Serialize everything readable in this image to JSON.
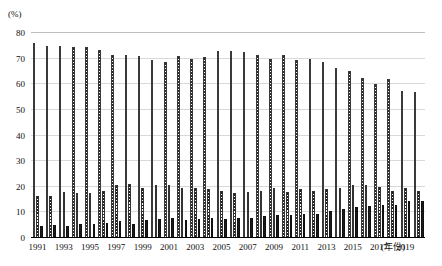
{
  "chart_data": {
    "type": "bar",
    "title": "",
    "subtitle": "",
    "xlabel": "(年份)",
    "ylabel": "(%)",
    "ylim": [
      0,
      80
    ],
    "ytick_values": [
      0,
      10,
      20,
      30,
      40,
      50,
      60,
      70,
      80
    ],
    "ytick_labels": [
      "0",
      "10",
      "20",
      "30",
      "40",
      "50",
      "60",
      "70",
      "80"
    ],
    "grid": true,
    "legend_position": "none",
    "categories": [
      "1991",
      "1992",
      "1993",
      "1994",
      "1995",
      "1996",
      "1997",
      "1998",
      "1999",
      "2000",
      "2001",
      "2002",
      "2003",
      "2004",
      "2005",
      "2006",
      "2007",
      "2008",
      "2009",
      "2010",
      "2011",
      "2012",
      "2013",
      "2014",
      "2015",
      "2016",
      "2017",
      "2018",
      "2019",
      "2020"
    ],
    "xtick_labels": [
      "1991",
      "1993",
      "1995",
      "1997",
      "1999",
      "2001",
      "2003",
      "2005",
      "2007",
      "2009",
      "2011",
      "2013",
      "2015",
      "2017",
      "2019"
    ],
    "series": [
      {
        "name": "series-1",
        "values": [
          76.0,
          75.0,
          75.0,
          74.5,
          74.5,
          73.5,
          71.5,
          71.5,
          71.0,
          69.5,
          68.5,
          71.0,
          70.0,
          70.5,
          73.0,
          73.0,
          72.5,
          71.5,
          70.0,
          71.5,
          69.5,
          70.0,
          68.5,
          66.5,
          65.0,
          62.5,
          60.0,
          62.0,
          57.5,
          57.0
        ]
      },
      {
        "name": "series-2",
        "values": [
          16.5,
          16.5,
          18.0,
          17.5,
          17.5,
          18.5,
          20.5,
          21.0,
          19.5,
          20.5,
          20.5,
          19.5,
          19.5,
          19.0,
          18.5,
          17.5,
          18.0,
          18.5,
          19.5,
          18.0,
          19.0,
          18.5,
          19.0,
          19.5,
          20.5,
          20.5,
          20.0,
          18.5,
          19.5,
          18.5
        ]
      },
      {
        "name": "series-3",
        "values": [
          4.5,
          5.0,
          4.5,
          5.5,
          5.5,
          6.0,
          6.5,
          5.5,
          7.0,
          7.5,
          8.0,
          7.0,
          7.5,
          8.0,
          7.5,
          8.0,
          8.0,
          8.5,
          9.0,
          9.0,
          9.5,
          9.5,
          10.5,
          11.5,
          12.0,
          12.5,
          13.0,
          13.0,
          14.5,
          14.5
        ]
      }
    ]
  }
}
